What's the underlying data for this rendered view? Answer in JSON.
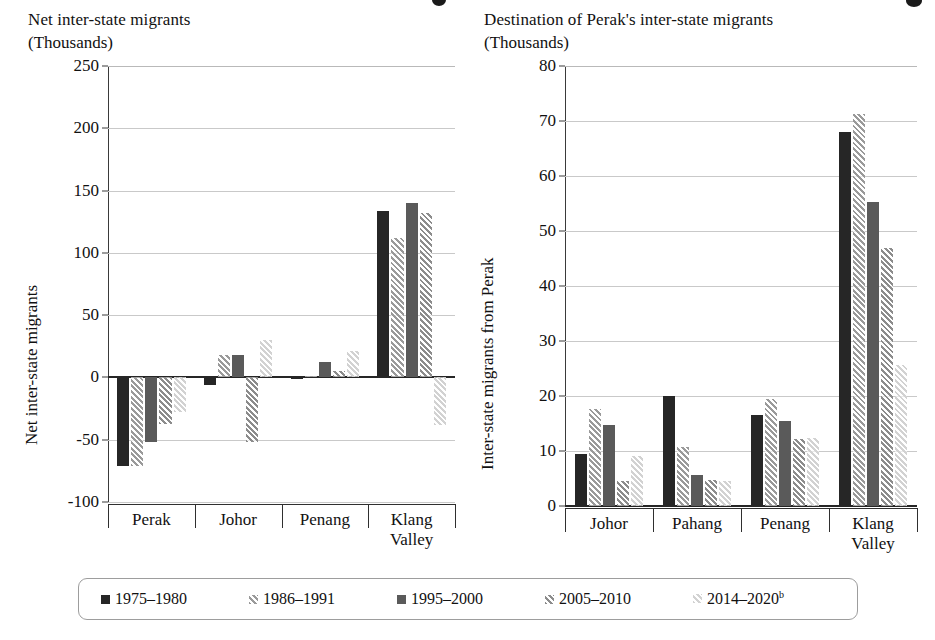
{
  "legend": {
    "items": [
      {
        "label": "1975–1980",
        "color": "#262626",
        "hatch": false
      },
      {
        "label": "1986–1991",
        "color": "#9a9a9a",
        "hatch": true
      },
      {
        "label": "1995–2000",
        "color": "#5a5a5a",
        "hatch": false
      },
      {
        "label": "2005–2010",
        "color": "#8c8c8c",
        "hatch": true
      },
      {
        "label": "2014–2020",
        "sup": "b",
        "color": "#d2d2d2",
        "hatch": true
      }
    ]
  },
  "chart_data": [
    {
      "type": "bar",
      "id": "net-inter-state-migrants",
      "title": "Net inter-state migrants",
      "units": "(Thousands)",
      "ylabel": "Net inter-state migrants",
      "xlabel": "",
      "ylim": [
        -100,
        250
      ],
      "yticks": [
        250,
        200,
        150,
        100,
        50,
        0,
        -50,
        -100
      ],
      "ytick_labels": [
        "250",
        "200",
        "150",
        "100",
        "50",
        "0",
        "-50",
        "-100"
      ],
      "grid": true,
      "legend_position": "bottom",
      "categories": [
        "Perak",
        "Johor",
        "Penang",
        "Klang Valley"
      ],
      "series": [
        {
          "name": "1975–1980",
          "values": [
            -71,
            -6,
            -1,
            134
          ]
        },
        {
          "name": "1986–1991",
          "values": [
            -71,
            18,
            1,
            112
          ]
        },
        {
          "name": "1995–2000",
          "values": [
            -52,
            18,
            12,
            140
          ]
        },
        {
          "name": "2005–2010",
          "values": [
            -37,
            -52,
            5,
            132
          ]
        },
        {
          "name": "2014–2020",
          "values": [
            -28,
            30,
            21,
            -38
          ]
        }
      ]
    },
    {
      "type": "bar",
      "id": "destination-of-peraks-inter-state-migrants",
      "title": "Destination of Perak's inter-state migrants",
      "units": "(Thousands)",
      "ylabel": "Inter-state migrants from Perak",
      "xlabel": "",
      "ylim": [
        0,
        80
      ],
      "yticks": [
        80,
        70,
        60,
        50,
        40,
        30,
        20,
        10,
        0
      ],
      "ytick_labels": [
        "80",
        "70",
        "60",
        "50",
        "40",
        "30",
        "20",
        "10",
        "0"
      ],
      "grid": true,
      "legend_position": "bottom",
      "categories": [
        "Johor",
        "Pahang",
        "Penang",
        "Klang Valley"
      ],
      "series": [
        {
          "name": "1975–1980",
          "values": [
            9.5,
            20.0,
            16.5,
            68.0
          ]
        },
        {
          "name": "1986–1991",
          "values": [
            17.6,
            10.8,
            19.4,
            71.3
          ]
        },
        {
          "name": "1995–2000",
          "values": [
            14.8,
            5.7,
            15.5,
            55.2
          ]
        },
        {
          "name": "2005–2010",
          "values": [
            4.6,
            4.7,
            12.2,
            47.0
          ]
        },
        {
          "name": "2014–2020",
          "values": [
            9.1,
            4.5,
            12.4,
            25.7
          ]
        }
      ]
    }
  ]
}
